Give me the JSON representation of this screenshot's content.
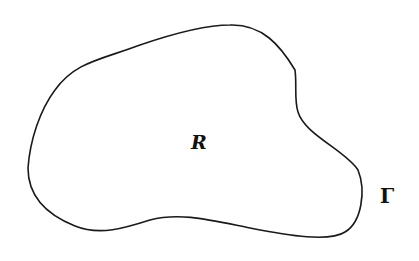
{
  "diagram": {
    "region_label": "R",
    "boundary_label": "Γ",
    "stroke_color": "#1a1a1a",
    "background": "#ffffff"
  }
}
